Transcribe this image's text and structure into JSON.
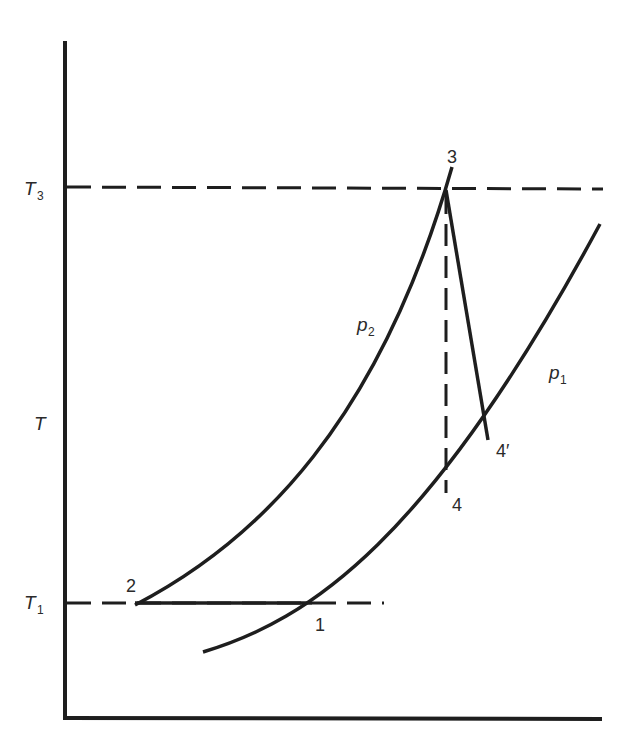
{
  "diagram": {
    "type": "T-s diagram (Brayton cycle with isobars)",
    "axis": {
      "y_label": "T",
      "x_label": ""
    },
    "reference_lines": [
      {
        "id": "T3",
        "label": "T",
        "subscript": "3"
      },
      {
        "id": "T1",
        "label": "T",
        "subscript": "1"
      }
    ],
    "isobars": [
      {
        "id": "p2",
        "label": "p",
        "subscript": "2"
      },
      {
        "id": "p1",
        "label": "p",
        "subscript": "1"
      }
    ],
    "state_points": [
      {
        "id": "1",
        "label": "1"
      },
      {
        "id": "2",
        "label": "2"
      },
      {
        "id": "3",
        "label": "3"
      },
      {
        "id": "4",
        "label": "4"
      },
      {
        "id": "4prime",
        "label": "4′"
      }
    ],
    "colors": {
      "line": "#1e1e1e",
      "background": "#ffffff"
    }
  }
}
